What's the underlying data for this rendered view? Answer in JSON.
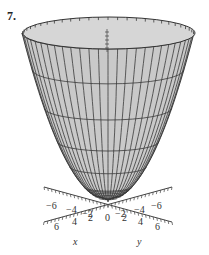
{
  "problem": {
    "number": "7."
  },
  "figure": {
    "type": "3d-surface",
    "colors": {
      "surface": "#c9c9c9",
      "surface_top": "#d6d6d6",
      "grid": "#3a3a3a",
      "axis": "#444444"
    },
    "z_axis_label": "z",
    "x_axis": {
      "label": "x",
      "ticks_negative": [
        "−6",
        "−4",
        "−2"
      ],
      "ticks_positive": [
        "6",
        "4",
        "2"
      ]
    },
    "y_axis": {
      "label": "y",
      "ticks_negative": [
        "−2",
        "−4",
        "−6"
      ],
      "ticks_positive": [
        "2",
        "4",
        "6"
      ]
    },
    "origin_label": "0"
  },
  "chart_data": {
    "type": "surface",
    "title": "",
    "xlabel": "x",
    "ylabel": "y",
    "zlabel": "z",
    "x_ticks": [
      -6,
      -4,
      -2,
      0,
      2,
      4,
      6
    ],
    "y_ticks": [
      -6,
      -4,
      -2,
      0,
      2,
      4,
      6
    ],
    "surface": "paraboloid (opens upward, vertex at origin)"
  }
}
